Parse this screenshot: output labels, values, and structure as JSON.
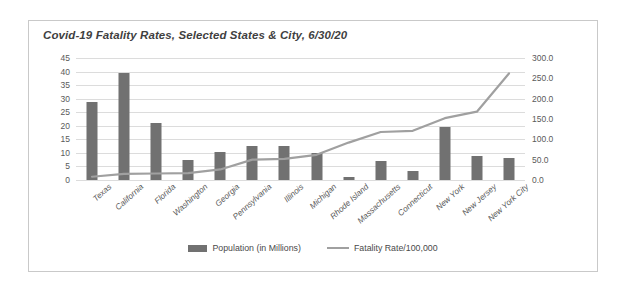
{
  "chart_data": {
    "type": "bar",
    "title": "Covid-19 Fatality Rates,  Selected States & City, 6/30/20",
    "xlabel": "",
    "ylabel": "",
    "grid": true,
    "legend_position": "bottom",
    "categories": [
      "Texas",
      "California",
      "Florida",
      "Washington",
      "Georgia",
      "Pennsylvania",
      "Illinois",
      "Michigan",
      "Rhode Island",
      "Massachusetts",
      "Connecticut",
      "New York",
      "New Jersey",
      "New York City"
    ],
    "series": [
      {
        "name": "Population (in Millions)",
        "type": "bar",
        "axis": "left",
        "color": "#717171",
        "values": [
          28.8,
          39.3,
          21.2,
          7.5,
          10.5,
          12.6,
          12.4,
          9.8,
          1.0,
          6.9,
          3.5,
          19.4,
          8.8,
          8.3
        ]
      },
      {
        "name": "Fatality Rate/100,000",
        "type": "line",
        "axis": "right",
        "color": "#a0a0a0",
        "values": [
          8.0,
          15.0,
          16.0,
          17.0,
          26.0,
          50.0,
          52.0,
          62.0,
          92.0,
          118.0,
          121.0,
          152.0,
          168.0,
          262.0
        ]
      }
    ],
    "left_axis": {
      "min": 0,
      "max": 45,
      "step": 5,
      "ticks": [
        "0",
        "5",
        "10",
        "15",
        "20",
        "25",
        "30",
        "35",
        "40",
        "45"
      ]
    },
    "right_axis": {
      "min": 0,
      "max": 300,
      "step": 50,
      "ticks": [
        "0.0",
        "50.0",
        "100.0",
        "150.0",
        "200.0",
        "250.0",
        "300.0"
      ]
    }
  },
  "legend": {
    "items": [
      {
        "label": "Population (in Millions)",
        "marker": "bar-swatch-icon"
      },
      {
        "label": "Fatality Rate/100,000",
        "marker": "line-swatch-icon"
      }
    ]
  }
}
